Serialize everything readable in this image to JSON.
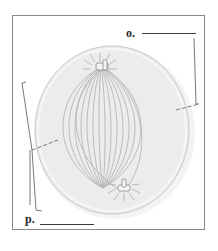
{
  "diagram": {
    "labels": [
      {
        "id": "o",
        "text": "o.",
        "answer_line": ""
      },
      {
        "id": "p",
        "text": "p.",
        "answer_line": ""
      }
    ],
    "structures": [
      "cell membrane",
      "spindle fibers",
      "centrosome (top)",
      "centrosome (bottom)",
      "equatorial plane indicator"
    ],
    "colors": {
      "frame": "#8a8a8a",
      "cell_fill": "#ececec",
      "cell_edge": "#c8c8c8",
      "fiber": "#b5b5b5",
      "leader_line": "#6a6a6a",
      "label_text": "#2a2a2a"
    }
  }
}
